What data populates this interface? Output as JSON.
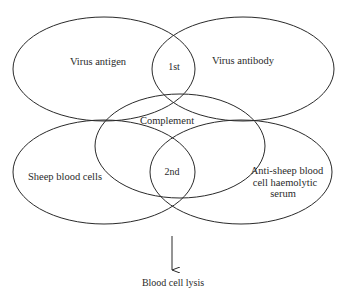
{
  "diagram": {
    "type": "overlapping-ellipses",
    "sets": [
      {
        "id": "virus-antigen",
        "label": "Virus antigen",
        "cx": 104,
        "cy": 69,
        "rx": 91,
        "ry": 52
      },
      {
        "id": "virus-antibody",
        "label": "Virus antibody",
        "cx": 243,
        "cy": 69,
        "rx": 91,
        "ry": 52
      },
      {
        "id": "complement",
        "label": "Complement",
        "cx": 180,
        "cy": 146,
        "rx": 85,
        "ry": 52
      },
      {
        "id": "sheep-blood-cells",
        "label": "Sheep blood cells",
        "cx": 104,
        "cy": 172,
        "rx": 91,
        "ry": 52
      },
      {
        "id": "anti-sheep-serum",
        "label_lines": [
          "Anti-sheep blood",
          "cell haemolytic",
          "serum"
        ],
        "cx": 241,
        "cy": 172,
        "rx": 91,
        "ry": 52
      }
    ],
    "intersections": [
      {
        "id": "first-reaction",
        "label": "1st"
      },
      {
        "id": "second-reaction",
        "label": "2nd"
      }
    ],
    "outcome": {
      "arrow": "down-arrow",
      "label": "Blood cell lysis"
    },
    "stroke_color": "#2a2a2a",
    "background": "#ffffff"
  }
}
